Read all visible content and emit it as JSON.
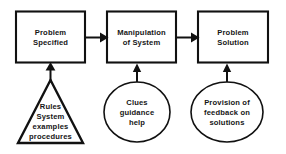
{
  "diagram": {
    "background_color": "#ffffff",
    "stroke_color": "#111111",
    "text_color": "#161616",
    "boxes": [
      {
        "id": "problem-specified",
        "line1": "Problem",
        "line2": "Specified"
      },
      {
        "id": "manipulation-of-system",
        "line1": "Manipulation",
        "line2": "of System"
      },
      {
        "id": "problem-solution",
        "line1": "Problem",
        "line2": "Solution"
      }
    ],
    "triangle": {
      "id": "rules-system-examples-procedures",
      "line1": "Rules",
      "line2": "System",
      "line3": "examples",
      "line4": "procedures"
    },
    "ellipses": [
      {
        "id": "clues-guidance-help",
        "line1": "Clues",
        "line2": "guidance",
        "line3": "help"
      },
      {
        "id": "provision-of-feedback-on-solutions",
        "line1": "Provision of",
        "line2": "feedback on",
        "line3": "solutions"
      }
    ],
    "arrows": [
      {
        "id": "arrow-box1-to-box2",
        "direction": "right"
      },
      {
        "id": "arrow-box2-to-box3",
        "direction": "right"
      },
      {
        "id": "arrow-triangle-to-box1",
        "direction": "up"
      },
      {
        "id": "arrow-ellipse1-to-box2",
        "direction": "up"
      },
      {
        "id": "arrow-ellipse2-to-box3",
        "direction": "up"
      }
    ]
  }
}
